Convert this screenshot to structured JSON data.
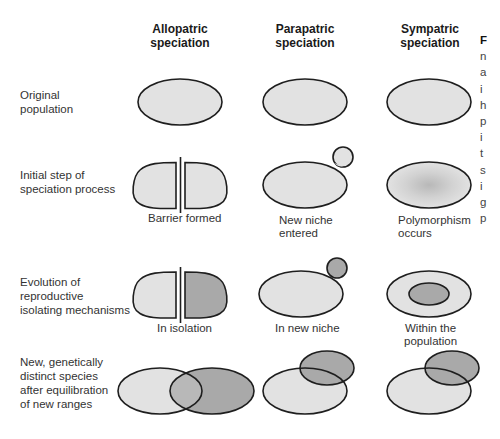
{
  "columns": [
    {
      "line1": "Allopatric",
      "line2": "speciation"
    },
    {
      "line1": "Parapatric",
      "line2": "speciation"
    },
    {
      "line1": "Sympatric",
      "line2": "speciation"
    }
  ],
  "rows": [
    {
      "lines": [
        "Original",
        "population"
      ]
    },
    {
      "lines": [
        "Initial step of",
        "speciation process"
      ]
    },
    {
      "lines": [
        "Evolution of",
        "reproductive",
        "isolating mechanisms"
      ]
    },
    {
      "lines": [
        "New, genetically",
        "distinct species",
        "after equilibration",
        "of new ranges"
      ]
    }
  ],
  "captions": {
    "row2": {
      "allopatric": [
        "Barrier formed"
      ],
      "parapatric": [
        "New niche",
        "entered"
      ],
      "sympatric": [
        "Polymorphism",
        "occurs"
      ]
    },
    "row3": {
      "allopatric": [
        "In isolation"
      ],
      "parapatric": [
        "In new niche"
      ],
      "sympatric": [
        "Within the",
        "population"
      ]
    }
  },
  "cut_off_text_fragments": [
    "F",
    "n",
    "a",
    "i",
    "h",
    "p",
    "i",
    "t",
    "s",
    "i",
    "g",
    "p"
  ],
  "colors": {
    "light_fill": "#e2e2e2",
    "dark_fill": "#a9a9a9",
    "outline": "#1e1e1e",
    "background": "#ffffff"
  }
}
